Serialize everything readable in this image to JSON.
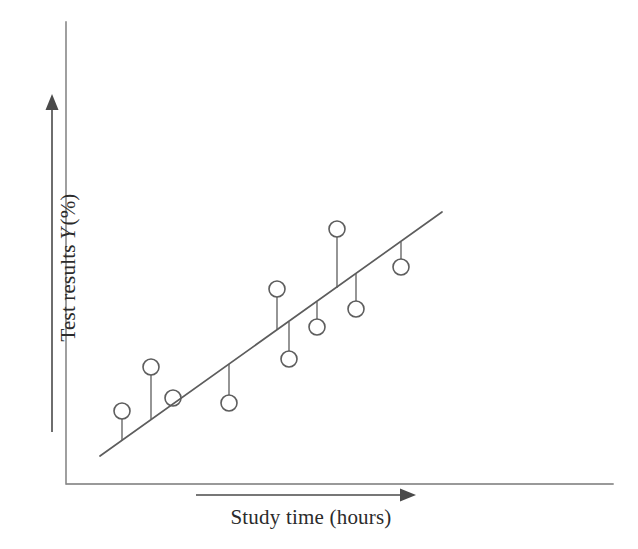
{
  "figure": {
    "background_color": "#ffffff",
    "ink_color": "#555555",
    "text_color": "#2b2b2b"
  },
  "axes": {
    "y_axis": {
      "x": 66,
      "y_top": 22,
      "y_bottom": 484
    },
    "x_axis": {
      "y": 484,
      "x_left": 67,
      "x_right": 613
    },
    "y_label_arrow": {
      "x": 52,
      "y_head": 94,
      "y_tail": 432
    },
    "x_label_arrow": {
      "y": 495,
      "x_tail": 196,
      "x_head": 416
    }
  },
  "labels": {
    "ylabel_prefix": "Test results",
    "ylabel_variable": "Y",
    "ylabel_suffix": "(%)",
    "xlabel": "Study time (hours)"
  },
  "chart_data": {
    "type": "scatter",
    "title": "",
    "xlabel": "Study time (hours)",
    "ylabel": "Test results Y (%)",
    "grid": false,
    "legend": null,
    "axis_ticks": {
      "x": [],
      "y": []
    },
    "regression_line": {
      "label": "fitted line",
      "x0": 100,
      "y0": 456,
      "x1": 442,
      "y1": 212,
      "color": "#5d5d5d",
      "width": 1.7
    },
    "marker": {
      "shape": "open-circle",
      "radius": 8,
      "fill": "none",
      "stroke": "#5d5d5d",
      "stroke_width": 1.6
    },
    "points": [
      {
        "id": 1,
        "cx": 122,
        "cy": 411,
        "line_y": 440,
        "residual": "positive"
      },
      {
        "id": 2,
        "cx": 151,
        "cy": 367,
        "line_y": 419,
        "residual": "positive"
      },
      {
        "id": 3,
        "cx": 173,
        "cy": 398,
        "line_y": 404,
        "residual": "on-line"
      },
      {
        "id": 4,
        "cx": 229,
        "cy": 403,
        "line_y": 364,
        "residual": "negative"
      },
      {
        "id": 5,
        "cx": 277,
        "cy": 289,
        "line_y": 330,
        "residual": "positive"
      },
      {
        "id": 6,
        "cx": 289,
        "cy": 359,
        "line_y": 322,
        "residual": "negative"
      },
      {
        "id": 7,
        "cx": 317,
        "cy": 327,
        "line_y": 302,
        "residual": "negative"
      },
      {
        "id": 8,
        "cx": 337,
        "cy": 229,
        "line_y": 288,
        "residual": "positive"
      },
      {
        "id": 9,
        "cx": 356,
        "cy": 309,
        "line_y": 274,
        "residual": "negative"
      },
      {
        "id": 10,
        "cx": 401,
        "cy": 267,
        "line_y": 242,
        "residual": "negative"
      }
    ]
  }
}
